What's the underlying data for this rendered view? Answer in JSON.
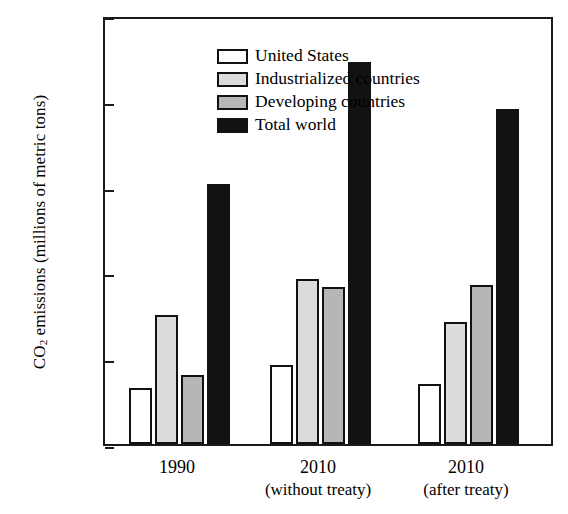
{
  "chart_data": {
    "type": "bar",
    "title": "",
    "xlabel": "",
    "ylabel": "CO2 emissions (millions of metric tons)",
    "ylabel_parts": {
      "pre": "CO",
      "sub": "2",
      "post": " emissions (millions of metric tons)"
    },
    "ylim": [
      0,
      10000
    ],
    "yticks": [
      0,
      2000,
      4000,
      6000,
      8000,
      10000
    ],
    "ytick_labels": [
      "0",
      "2000",
      "4000",
      "6000",
      "8000",
      "10,000"
    ],
    "grid": false,
    "legend_position": "top-left",
    "categories": [
      "1990",
      "2010",
      "2010"
    ],
    "category_sublabels": [
      "",
      "(without treaty)",
      "(after treaty)"
    ],
    "series": [
      {
        "name": "United States",
        "color": "#ffffff",
        "values": [
          1300,
          1850,
          1400
        ]
      },
      {
        "name": "Industrialized countries",
        "color": "#dcdcdc",
        "values": [
          3000,
          3850,
          2850
        ]
      },
      {
        "name": "Developing countries",
        "color": "#b6b6b6",
        "values": [
          1600,
          3650,
          3700
        ]
      },
      {
        "name": "Total world",
        "color": "#121212",
        "values": [
          6050,
          8900,
          7800
        ]
      }
    ]
  },
  "legend": {
    "items": [
      {
        "label": "United States"
      },
      {
        "label": "Industrialized countries"
      },
      {
        "label": "Developing countries"
      },
      {
        "label": "Total world"
      }
    ]
  }
}
